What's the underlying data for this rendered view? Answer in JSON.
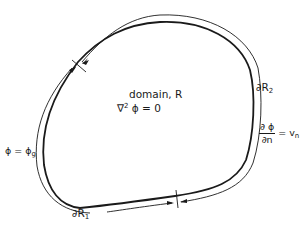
{
  "diagram": {
    "domain_label": "domain, R",
    "equation": {
      "operator": "∇",
      "power": "2",
      "rest": " ϕ  =  0"
    },
    "boundary_2": {
      "symbol": "∂R",
      "subscript": "2"
    },
    "boundary_1": {
      "symbol": "∂R",
      "subscript": "1"
    },
    "dirichlet_condition": {
      "lhs": "ϕ = ϕ",
      "subscript": "g"
    },
    "neumann_condition": {
      "numerator": "∂ ϕ",
      "denominator": "∂n",
      "equals": " = v",
      "subscript": "n"
    },
    "colors": {
      "stroke": "#1a1a1a",
      "background": "#ffffff"
    }
  }
}
